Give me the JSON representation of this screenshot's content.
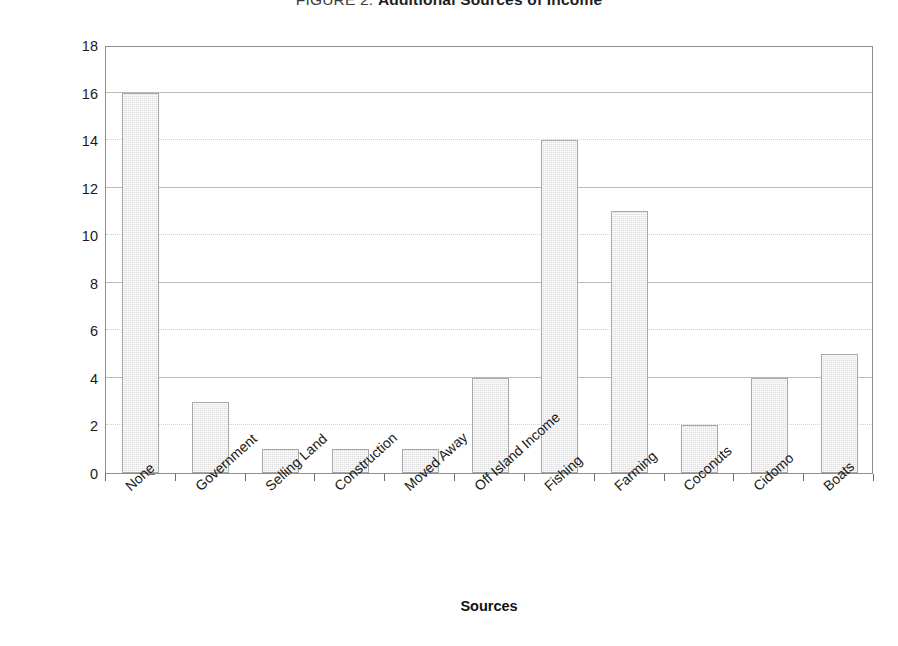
{
  "chart_data": {
    "type": "bar",
    "title": "FIGURE 2: Additional Sources of Income",
    "title_prefix": "FIGURE 2: ",
    "title_main": "Additional Sources of Income",
    "xlabel": "Sources",
    "ylabel": "Number of Owners/Managers",
    "categories": [
      "None",
      "Government",
      "Selling Land",
      "Construction",
      "Moved Away",
      "Off Island Income",
      "Fishing",
      "Farming",
      "Coconuts",
      "Cidomo",
      "Boats"
    ],
    "values": [
      16,
      3,
      1,
      1,
      1,
      4,
      14,
      11,
      2,
      4,
      5
    ],
    "ylim": [
      0,
      18
    ],
    "yticks": [
      0,
      2,
      4,
      6,
      8,
      10,
      12,
      14,
      16,
      18
    ],
    "ytick_labels": [
      "0",
      "2",
      "4",
      "6",
      "8",
      "10",
      "12",
      "14",
      "16",
      "18"
    ],
    "grid": true,
    "legend": false,
    "bar_fill_color": "#dedede",
    "bar_border_color": "#a8a8a8",
    "axis_color": "#8d8d8d",
    "grid_color": "#b9b9b9",
    "background_color": "#ffffff",
    "text_color": "#1a1a1a"
  }
}
